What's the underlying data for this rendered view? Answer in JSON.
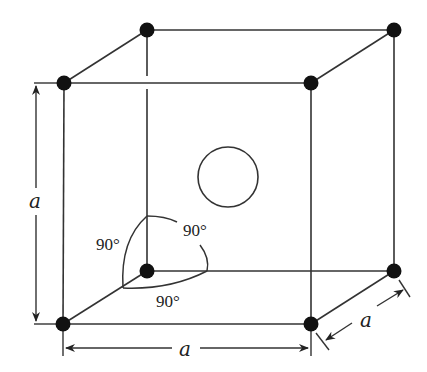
{
  "diagram": {
    "labels": {
      "height": "a",
      "width": "a",
      "depth": "a",
      "angle_left": "90°",
      "angle_right": "90°",
      "angle_bottom": "90°"
    },
    "atoms": {
      "front_top_left": [
        64,
        83
      ],
      "front_top_right": [
        311,
        83
      ],
      "front_bottom_left": [
        63,
        324
      ],
      "front_bottom_right": [
        311,
        324
      ],
      "back_top_left": [
        147,
        30
      ],
      "back_top_right": [
        394,
        30
      ],
      "back_bottom_left": [
        147,
        271
      ],
      "back_bottom_right": [
        394,
        271
      ]
    },
    "body_center": {
      "cx": 228,
      "cy": 177,
      "r": 30
    },
    "colors": {
      "line": "#333333",
      "atom": "#111111",
      "background": "#ffffff"
    }
  }
}
